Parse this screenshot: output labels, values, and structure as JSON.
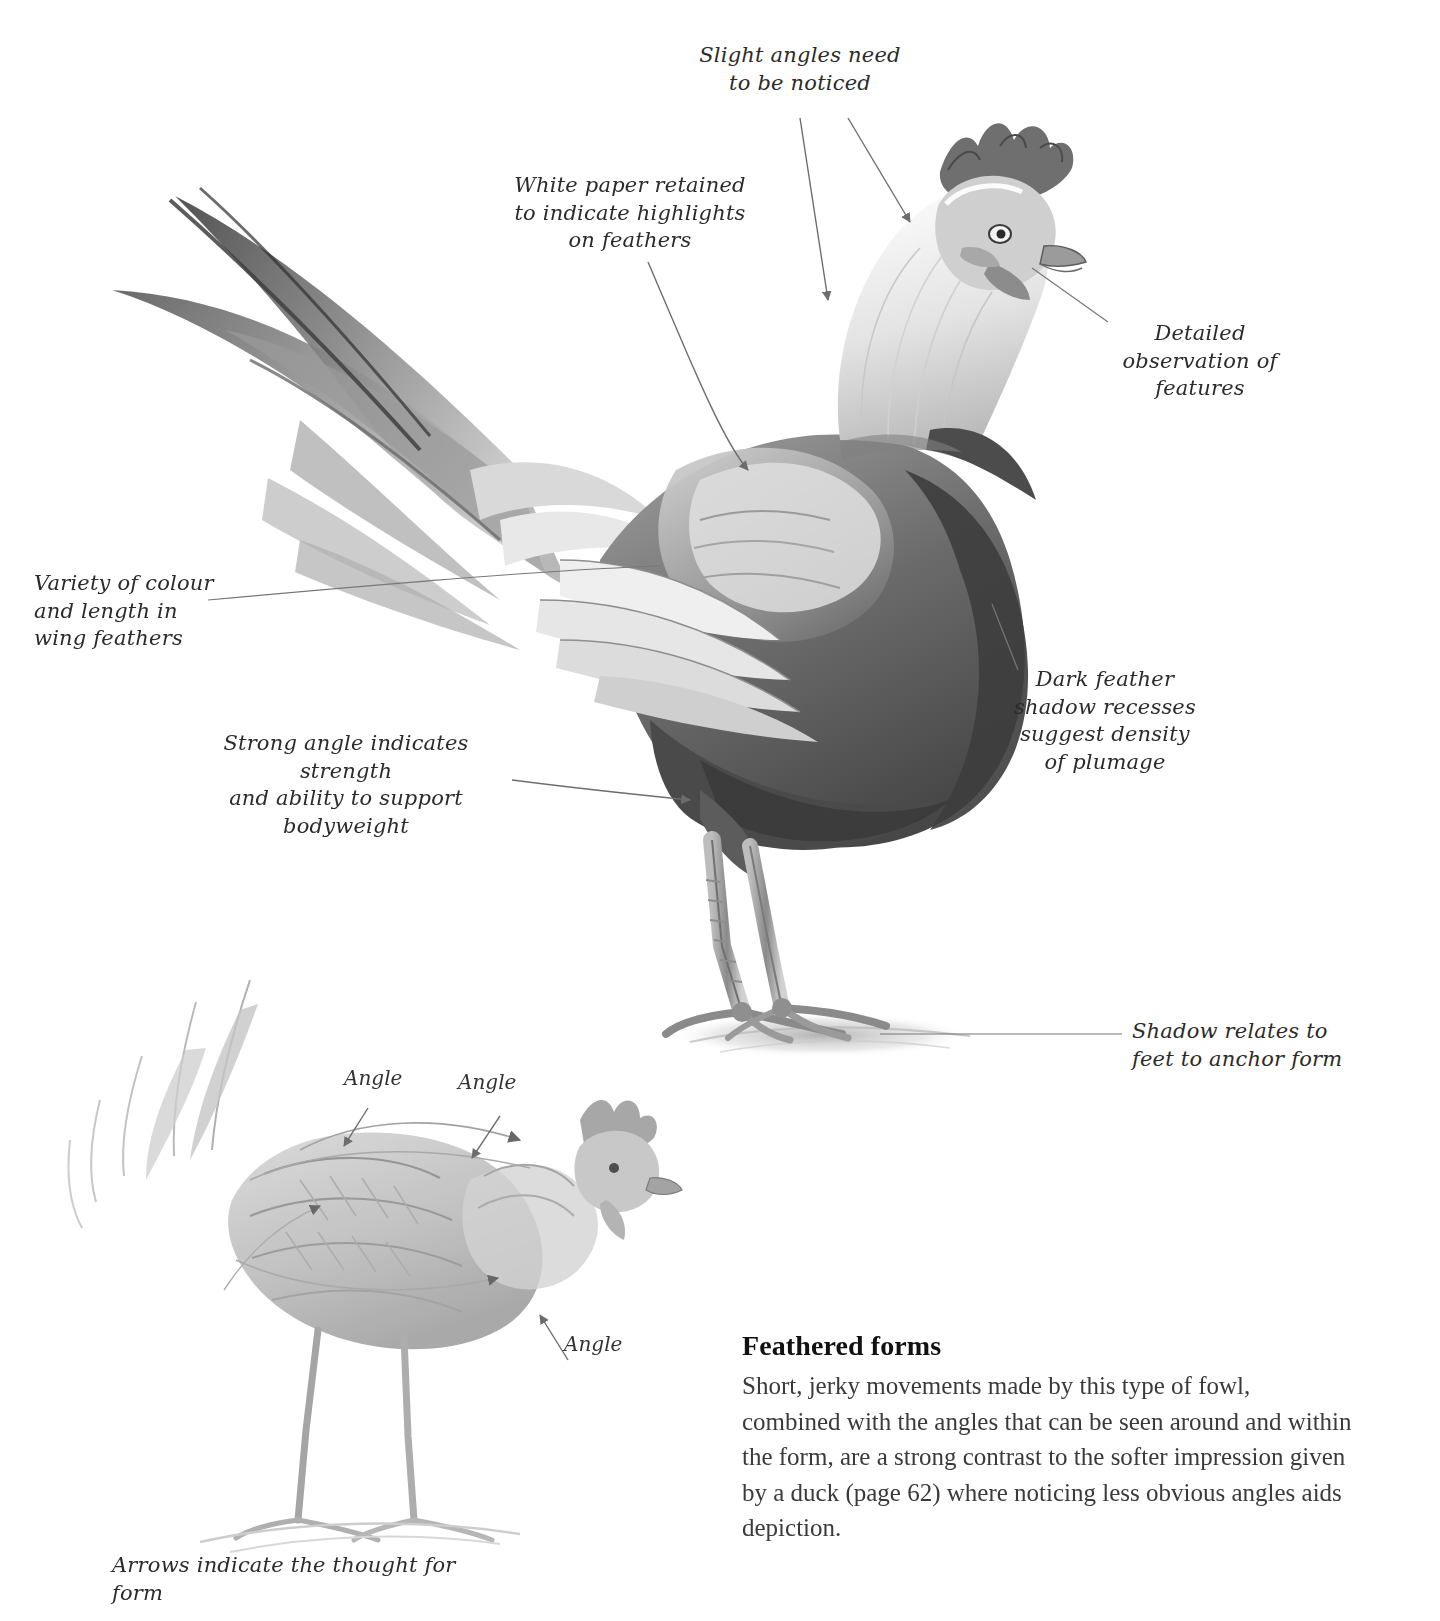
{
  "page": {
    "title": "Feathered forms",
    "width": 1440,
    "height": 1621,
    "background": "#ffffff",
    "ink_color": "#2b2b2b"
  },
  "annotations": [
    {
      "id": "slight-angles",
      "text": "Slight angles need\nto be noticed"
    },
    {
      "id": "white-paper",
      "text": "White paper retained\nto indicate highlights\non feathers"
    },
    {
      "id": "detailed-observation",
      "text": "Detailed\nobservation of\nfeatures"
    },
    {
      "id": "dark-feather",
      "text": "Dark feather\nshadow recesses\nsuggest density\nof plumage"
    },
    {
      "id": "variety-colour",
      "text": "Variety of colour\nand length in\nwing feathers"
    },
    {
      "id": "strong-angle",
      "text": "Strong angle indicates strength\nand ability to support bodyweight"
    },
    {
      "id": "shadow-relates",
      "text": "Shadow relates to\nfeet to anchor form"
    },
    {
      "id": "arrows-indicate",
      "text": "Arrows indicate the thought for form"
    }
  ],
  "angle_labels": [
    {
      "id": "angle-1",
      "text": "Angle"
    },
    {
      "id": "angle-2",
      "text": "Angle"
    },
    {
      "id": "angle-3",
      "text": "Angle"
    }
  ],
  "caption": {
    "heading": "Feathered forms",
    "body": "Short, jerky movements made by this type of fowl, combined with the angles that can be seen around and within the form, are a strong contrast to the softer impression given by a duck (page 62) where noticing less obvious angles aids depiction."
  },
  "artwork": {
    "main_drawing": "pencil-rooster-standing",
    "sketch_drawing": "pencil-rooster-sketch-with-angles"
  }
}
